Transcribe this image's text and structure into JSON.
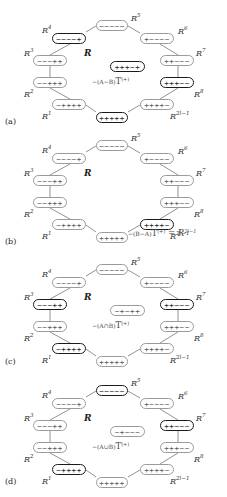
{
  "panels": [
    {
      "label": "(a)",
      "region_label": "R",
      "nodes": {
        "R0": {
          "signs": "+++++",
          "bold": true
        },
        "R1": {
          "signs": "−++++",
          "bold": false
        },
        "R2": {
          "signs": "−−+++",
          "bold": false
        },
        "R3": {
          "signs": "−−−++",
          "bold": false
        },
        "R4": {
          "signs": "−−−−+",
          "bold": true
        },
        "R5": {
          "signs": "−−−−−",
          "bold": false
        },
        "R6": {
          "signs": "+−−−−",
          "bold": false
        },
        "R7": {
          "signs": "++−−−",
          "bold": false
        },
        "R8": {
          "signs": "+++−−",
          "bold": true
        },
        "R2l1": {
          "signs": "++++−",
          "bold": false
        },
        "center": {
          "signs": "+++−+",
          "bold": true
        }
      },
      "formula": {
        "prefix": "−(A−B)",
        "T": "T",
        "sup": "(+)",
        "suffix": ""
      }
    },
    {
      "label": "(b)",
      "region_label": "R",
      "nodes": {
        "R0": {
          "signs": "+++++",
          "bold": false
        },
        "R1": {
          "signs": "−++++",
          "bold": false
        },
        "R2": {
          "signs": "−−+++",
          "bold": false
        },
        "R3": {
          "signs": "−−−++",
          "bold": false
        },
        "R4": {
          "signs": "−−−−+",
          "bold": false
        },
        "R5": {
          "signs": "−−−−−",
          "bold": false
        },
        "R6": {
          "signs": "+−−−−",
          "bold": false
        },
        "R7": {
          "signs": "++−−−",
          "bold": false
        },
        "R8": {
          "signs": "+++−−",
          "bold": false
        },
        "R2l1": {
          "signs": "++++−",
          "bold": true
        },
        "center": null
      },
      "formula": {
        "prefix": "−(B−A)",
        "T": "T",
        "sup": "(+)",
        "suffix": " = R",
        "suffix_sup": "2l−1"
      }
    },
    {
      "label": "(c)",
      "region_label": "R",
      "nodes": {
        "R0": {
          "signs": "+++++",
          "bold": false
        },
        "R1": {
          "signs": "−++++",
          "bold": true
        },
        "R2": {
          "signs": "−−+++",
          "bold": false
        },
        "R3": {
          "signs": "−−−++",
          "bold": true
        },
        "R4": {
          "signs": "−−−−+",
          "bold": false
        },
        "R5": {
          "signs": "−−−−−",
          "bold": false
        },
        "R6": {
          "signs": "+−−−−",
          "bold": false
        },
        "R7": {
          "signs": "++−−−",
          "bold": true
        },
        "R8": {
          "signs": "+++−−",
          "bold": false
        },
        "R2l1": {
          "signs": "++++−",
          "bold": false
        },
        "center": {
          "signs": "−+−++",
          "bold": false
        }
      },
      "formula": {
        "prefix": "−(A∩B)",
        "T": "T",
        "sup": "(+)",
        "suffix": ""
      }
    },
    {
      "label": "(d)",
      "region_label": "R",
      "nodes": {
        "R0": {
          "signs": "+++++",
          "bold": false
        },
        "R1": {
          "signs": "−++++",
          "bold": true
        },
        "R2": {
          "signs": "−−+++",
          "bold": false
        },
        "R3": {
          "signs": "−−−++",
          "bold": false
        },
        "R4": {
          "signs": "−−−−+",
          "bold": false
        },
        "R5": {
          "signs": "−−−−−",
          "bold": true
        },
        "R6": {
          "signs": "+−−−−",
          "bold": false
        },
        "R7": {
          "signs": "++−−−",
          "bold": true
        },
        "R8": {
          "signs": "+++−−",
          "bold": false
        },
        "R2l1": {
          "signs": "++++−",
          "bold": false
        },
        "center": {
          "signs": "−+−−−",
          "bold": false
        }
      },
      "formula": {
        "prefix": "−(A∪B)",
        "T": "T",
        "sup": "(+)",
        "suffix": ""
      }
    }
  ],
  "node_labels": {
    "R0": {
      "base": "R",
      "sup": "0"
    },
    "R1": {
      "base": "R",
      "sup": "1"
    },
    "R2": {
      "base": "R",
      "sup": "2"
    },
    "R3": {
      "base": "R",
      "sup": "3"
    },
    "R4": {
      "base": "R",
      "sup": "4"
    },
    "R5": {
      "base": "R",
      "sup": "5"
    },
    "R6": {
      "base": "R",
      "sup": "6"
    },
    "R7": {
      "base": "R",
      "sup": "7"
    },
    "R8": {
      "base": "R",
      "sup": "8"
    },
    "R2l1": {
      "base": "R",
      "sup": "2l−1"
    }
  }
}
